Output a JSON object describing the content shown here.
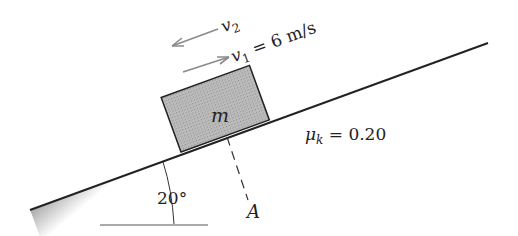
{
  "diagram": {
    "type": "incline-block",
    "incline_angle_label": "20°",
    "block_label": "m",
    "friction_label": "μk = 0.20",
    "friction_symbol": "μ",
    "friction_subscript": "k",
    "friction_value": "= 0.20",
    "point_label": "A",
    "velocities": [
      {
        "symbol": "v",
        "subscript": "2",
        "value": "",
        "direction": "down-slope"
      },
      {
        "symbol": "v",
        "subscript": "1",
        "value": "= 6 m/s",
        "direction": "up-slope"
      }
    ],
    "colors": {
      "block_fill": "#9a9a9a",
      "incline_line": "#222222",
      "arrow": "#8a8a8a"
    }
  }
}
